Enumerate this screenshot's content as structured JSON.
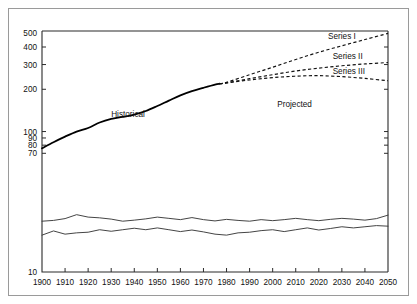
{
  "chart_data": {
    "type": "line",
    "title": "",
    "subtitle": "",
    "xlabel": "",
    "ylabel": "",
    "yscale": "log",
    "ylim": [
      10,
      520
    ],
    "xlim": [
      1900,
      2050
    ],
    "grid": false,
    "legend_position": "inline-annotation",
    "y_ticks": [
      {
        "value": 500,
        "label": "500"
      },
      {
        "value": 400,
        "label": "400"
      },
      {
        "value": 300,
        "label": "300"
      },
      {
        "value": 200,
        "label": "200"
      },
      {
        "value": 100,
        "label": "100"
      },
      {
        "value": 90,
        "label": "90"
      },
      {
        "value": 80,
        "label": "80"
      },
      {
        "value": 70,
        "label": "70"
      },
      {
        "value": 10,
        "label": "10"
      }
    ],
    "x_ticks": [
      {
        "value": 1900,
        "label": "1900"
      },
      {
        "value": 1910,
        "label": "1910"
      },
      {
        "value": 1920,
        "label": "1920"
      },
      {
        "value": 1930,
        "label": "1930"
      },
      {
        "value": 1940,
        "label": "1940"
      },
      {
        "value": 1950,
        "label": "1950"
      },
      {
        "value": 1960,
        "label": "1960"
      },
      {
        "value": 1970,
        "label": "1970"
      },
      {
        "value": 1980,
        "label": "1980"
      },
      {
        "value": 1990,
        "label": "1990"
      },
      {
        "value": 2000,
        "label": "2000"
      },
      {
        "value": 2010,
        "label": "2010"
      },
      {
        "value": 2020,
        "label": "2020"
      },
      {
        "value": 2030,
        "label": "2030"
      },
      {
        "value": 2040,
        "label": "2040"
      },
      {
        "value": 2050,
        "label": "2050"
      }
    ],
    "annotations": [
      {
        "name": "historical-label",
        "text": "Historical",
        "x": 1930,
        "y": 128
      },
      {
        "name": "projected-label",
        "text": "Projected",
        "x": 2002,
        "y": 150
      },
      {
        "name": "series-1-label",
        "text": "Series I",
        "x": 2024,
        "y": 455
      },
      {
        "name": "series-2-label",
        "text": "Series II",
        "x": 2026,
        "y": 330
      },
      {
        "name": "series-3-label",
        "text": "Series III",
        "x": 2026,
        "y": 258
      }
    ],
    "series": [
      {
        "name": "Historical",
        "style": "solid",
        "x": [
          1900,
          1905,
          1910,
          1915,
          1920,
          1925,
          1930,
          1935,
          1940,
          1945,
          1950,
          1955,
          1960,
          1965,
          1970,
          1975,
          1977
        ],
        "values": [
          76,
          84,
          92,
          100,
          106,
          116,
          123,
          127,
          132,
          140,
          152,
          166,
          181,
          194,
          205,
          216,
          219
        ]
      },
      {
        "name": "Series I",
        "style": "dashed",
        "x": [
          1977,
          1980,
          1990,
          2000,
          2010,
          2020,
          2030,
          2040,
          2050
        ],
        "values": [
          219,
          224,
          254,
          287,
          326,
          367,
          408,
          452,
          500
        ]
      },
      {
        "name": "Series II",
        "style": "dashed",
        "x": [
          1977,
          1980,
          1990,
          2000,
          2010,
          2020,
          2030,
          2040,
          2050
        ],
        "values": [
          219,
          222,
          238,
          254,
          270,
          283,
          294,
          303,
          310
        ]
      },
      {
        "name": "Series III",
        "style": "dashed",
        "x": [
          1977,
          1980,
          1990,
          2000,
          2010,
          2020,
          2030,
          2040,
          2050
        ],
        "values": [
          219,
          222,
          233,
          242,
          248,
          250,
          246,
          239,
          230
        ]
      },
      {
        "name": "Rate Upper",
        "style": "solid-thin",
        "x": [
          1900,
          1905,
          1910,
          1915,
          1920,
          1925,
          1930,
          1935,
          1940,
          1945,
          1950,
          1955,
          1960,
          1965,
          1970,
          1975,
          1980,
          1985,
          1990,
          1995,
          2000,
          2005,
          2010,
          2015,
          2020,
          2025,
          2030,
          2035,
          2040,
          2045,
          2050
        ],
        "values": [
          23.0,
          23.3,
          24.0,
          25.6,
          24.6,
          24.3,
          23.8,
          23.0,
          23.4,
          23.9,
          24.6,
          24.1,
          23.6,
          24.4,
          23.6,
          23.1,
          23.7,
          23.3,
          23.0,
          23.6,
          23.2,
          23.6,
          24.1,
          23.6,
          23.2,
          23.7,
          24.1,
          23.8,
          23.4,
          24.0,
          25.4
        ]
      },
      {
        "name": "Rate Lower",
        "style": "solid-thin",
        "x": [
          1900,
          1905,
          1910,
          1915,
          1920,
          1925,
          1930,
          1935,
          1940,
          1945,
          1950,
          1955,
          1960,
          1965,
          1970,
          1975,
          1980,
          1985,
          1990,
          1995,
          2000,
          2005,
          2010,
          2015,
          2020,
          2025,
          2030,
          2035,
          2040,
          2045,
          2050
        ],
        "values": [
          18.3,
          19.6,
          18.6,
          19.0,
          19.2,
          20.0,
          19.5,
          20.0,
          20.5,
          20.0,
          20.6,
          20.0,
          19.4,
          19.9,
          19.3,
          18.6,
          18.3,
          19.0,
          19.2,
          19.7,
          20.0,
          19.4,
          20.0,
          20.6,
          19.9,
          20.4,
          21.0,
          20.6,
          21.0,
          21.4,
          21.2
        ]
      }
    ]
  },
  "figure": {
    "border_color": "#9a9a9a",
    "background": "#ffffff",
    "axis_color": "#2b2b2b"
  }
}
